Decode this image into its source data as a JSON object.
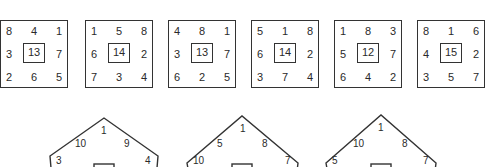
{
  "squares": [
    {
      "grid": [
        [
          "8",
          "4",
          "1"
        ],
        [
          "3",
          "",
          "7"
        ],
        [
          "2",
          "6",
          "5"
        ]
      ],
      "center": "13",
      "left": 0
    },
    {
      "grid": [
        [
          "1",
          "5",
          "8"
        ],
        [
          "6",
          "",
          "2"
        ],
        [
          "7",
          "3",
          "4"
        ]
      ],
      "center": "14",
      "left": 85
    },
    {
      "grid": [
        [
          "4",
          "8",
          "1"
        ],
        [
          "3",
          "",
          "7"
        ],
        [
          "6",
          "2",
          "5"
        ]
      ],
      "center": "13",
      "left": 168
    },
    {
      "grid": [
        [
          "5",
          "1",
          "8"
        ],
        [
          "6",
          "",
          "2"
        ],
        [
          "3",
          "7",
          "4"
        ]
      ],
      "center": "14",
      "left": 251
    },
    {
      "grid": [
        [
          "1",
          "8",
          "3"
        ],
        [
          "5",
          "",
          "7"
        ],
        [
          "6",
          "4",
          "2"
        ]
      ],
      "center": "12",
      "left": 334
    },
    {
      "grid": [
        [
          "8",
          "1",
          "6"
        ],
        [
          "4",
          "",
          "2"
        ],
        [
          "3",
          "5",
          "7"
        ]
      ],
      "center": "15",
      "left": 417
    }
  ],
  "pentagons": [
    {
      "apex": "1",
      "upper_left": "10",
      "upper_right": "9",
      "left": "3",
      "right": "4"
    },
    {
      "apex": "1",
      "upper_left": "5",
      "upper_right": "8",
      "left": "10",
      "right": "7"
    },
    {
      "apex": "1",
      "upper_left": "10",
      "upper_right": "8",
      "left": "5",
      "right": "7"
    }
  ]
}
